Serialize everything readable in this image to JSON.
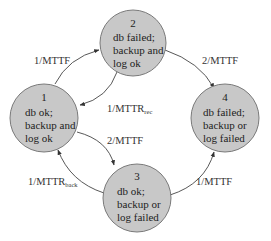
{
  "diagram": {
    "type": "state-transition",
    "colors": {
      "node_fill": "#c8c8c8",
      "node_stroke": "#7a7a7a",
      "edge": "#444444",
      "text": "#222222"
    },
    "nodes": [
      {
        "id": "1",
        "number": "1",
        "lines": [
          "db ok;",
          "backup and",
          "log ok"
        ]
      },
      {
        "id": "2",
        "number": "2",
        "lines": [
          "db failed;",
          "backup and",
          "log ok"
        ]
      },
      {
        "id": "3",
        "number": "3",
        "lines": [
          "db ok;",
          "backup or",
          "log failed"
        ]
      },
      {
        "id": "4",
        "number": "4",
        "lines": [
          "db failed;",
          "backup or",
          "log failed"
        ]
      }
    ],
    "edges": [
      {
        "from": "1",
        "to": "2",
        "label": "1/MTTF",
        "sub": ""
      },
      {
        "from": "2",
        "to": "1",
        "label": "1/MTTR",
        "sub": "rec"
      },
      {
        "from": "2",
        "to": "4",
        "label": "2/MTTF",
        "sub": ""
      },
      {
        "from": "1",
        "to": "3",
        "label": "2/MTTF",
        "sub": ""
      },
      {
        "from": "3",
        "to": "1",
        "label": "1/MTTR",
        "sub": "back"
      },
      {
        "from": "3",
        "to": "4",
        "label": "1/MTTF",
        "sub": ""
      }
    ]
  }
}
